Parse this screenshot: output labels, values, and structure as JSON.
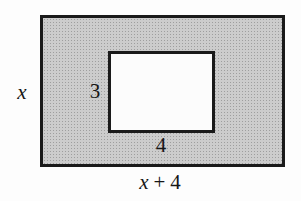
{
  "diagram": {
    "colors": {
      "shaded_region": "#cccccc",
      "outline": "#1a1a1a",
      "inner_fill": "#fcfcfc",
      "background": "#fdfdfd"
    },
    "outer_rectangle": {
      "side_label": "x",
      "bottom_label_variable": "x",
      "bottom_label_operator": "+",
      "bottom_label_constant": "4"
    },
    "inner_rectangle": {
      "side_label": "3",
      "bottom_label": "4"
    }
  }
}
